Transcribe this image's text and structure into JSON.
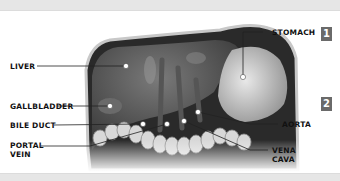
{
  "diagram": {
    "type": "labeled anatomical illustration",
    "labels": [
      {
        "id": "liver",
        "text": "LIVER",
        "side": "left"
      },
      {
        "id": "gallbladder",
        "text": "GALLBLADDER",
        "side": "left"
      },
      {
        "id": "bile-duct",
        "text": "BILE DUCT",
        "side": "left"
      },
      {
        "id": "portal-vein",
        "text": "PORTAL\nVEIN",
        "side": "left"
      },
      {
        "id": "stomach",
        "text": "STOMACH",
        "side": "right"
      },
      {
        "id": "aorta",
        "text": "AORTA",
        "side": "right"
      },
      {
        "id": "vena-cava",
        "text": "VENA\nCAVA",
        "side": "right"
      }
    ],
    "badges": [
      {
        "id": "badge-1",
        "text": "1"
      },
      {
        "id": "badge-2",
        "text": "2"
      }
    ]
  },
  "colors": {
    "band": "#e6e6e6",
    "badge": "#6a6a6a",
    "label_text": "#111111",
    "leader_line": "#222222",
    "marker_dot": "#ffffff"
  }
}
